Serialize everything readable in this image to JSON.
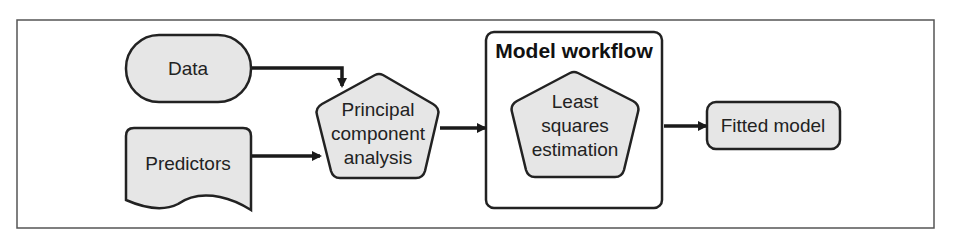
{
  "diagram": {
    "frame": {
      "border_color": "#555555",
      "background": "#ffffff"
    },
    "colors": {
      "node_fill": "#e6e6e6",
      "stroke": "#222222",
      "text": "#222222",
      "arrow": "#1a1a1a"
    },
    "nodes": {
      "data": {
        "label": "Data",
        "shape": "terminator"
      },
      "predictors": {
        "label": "Predictors",
        "shape": "document"
      },
      "pca": {
        "lines": [
          "Principal",
          "component",
          "analysis"
        ],
        "shape": "pentagon"
      },
      "workflow": {
        "title": "Model workflow",
        "shape": "container"
      },
      "lse": {
        "lines": [
          "Least",
          "squares",
          "estimation"
        ],
        "shape": "pentagon"
      },
      "fitted": {
        "label": "Fitted model",
        "shape": "rounded-rect"
      }
    },
    "edges": [
      {
        "from": "Data",
        "to": "Principal component analysis"
      },
      {
        "from": "Predictors",
        "to": "Principal component analysis"
      },
      {
        "from": "Principal component analysis",
        "to": "Model workflow"
      },
      {
        "from": "Model workflow",
        "to": "Fitted model"
      }
    ]
  }
}
